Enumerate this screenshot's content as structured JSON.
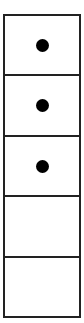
{
  "board": {
    "cells": [
      {
        "filled": true
      },
      {
        "filled": true
      },
      {
        "filled": true
      },
      {
        "filled": false
      },
      {
        "filled": false
      }
    ],
    "colors": {
      "border": "#222222",
      "dot": "#000000",
      "background": "#ffffff"
    }
  }
}
